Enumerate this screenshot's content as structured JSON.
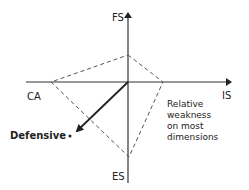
{
  "diagram": {
    "type": "strategic-position-action-evaluation",
    "axes": {
      "top": "FS",
      "bottom": "ES",
      "left": "CA",
      "right": "IS"
    },
    "vector_label": "Defensive",
    "annotation": [
      "Relative",
      "weakness",
      "on most",
      "dimensions"
    ],
    "colors": {
      "axis": "#222222",
      "dashed": "#555555",
      "text": "#222222"
    }
  }
}
